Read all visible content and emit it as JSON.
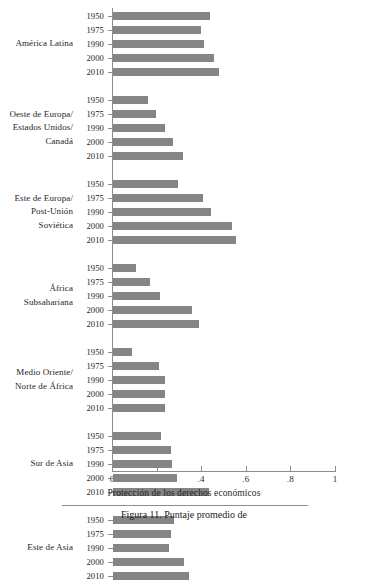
{
  "chart_data": {
    "type": "bar",
    "orientation": "horizontal",
    "title": "",
    "xlabel": "Protección de los derechos económicos",
    "ylabel": "",
    "xlim": [
      0,
      1
    ],
    "xticks": [
      0,
      0.2,
      0.4,
      0.6,
      0.8,
      1
    ],
    "xticklabels": [
      "0",
      ".2",
      ".4",
      ".6",
      ".8",
      "1"
    ],
    "grid": false,
    "legend": false,
    "bar_color": "#858585",
    "axis_color": "#8c8c8c",
    "categories": [
      "1950",
      "1975",
      "1990",
      "2000",
      "2010"
    ],
    "groups": [
      {
        "label": "América Latina",
        "values": [
          0.435,
          0.395,
          0.41,
          0.455,
          0.475
        ]
      },
      {
        "label": "Oeste de Europa/\nEstados Unidos/\nCanadá",
        "values": [
          0.155,
          0.195,
          0.235,
          0.27,
          0.315
        ]
      },
      {
        "label": "Este de Europa/\nPost-Unión\nSoviética",
        "values": [
          0.29,
          0.405,
          0.44,
          0.535,
          0.55
        ]
      },
      {
        "label": "África\nSubsahariana",
        "values": [
          0.105,
          0.165,
          0.21,
          0.355,
          0.385
        ]
      },
      {
        "label": "Medio Oriente/\nNorte de África",
        "values": [
          0.085,
          0.205,
          0.235,
          0.235,
          0.235
        ]
      },
      {
        "label": "Sur de Asia",
        "values": [
          0.215,
          0.26,
          0.265,
          0.285,
          0.43
        ]
      },
      {
        "label": "Este de Asia",
        "values": [
          0.275,
          0.26,
          0.25,
          0.32,
          0.34
        ]
      }
    ]
  },
  "caption": {
    "text": "Figura 11.  Puntaje promedio de"
  }
}
